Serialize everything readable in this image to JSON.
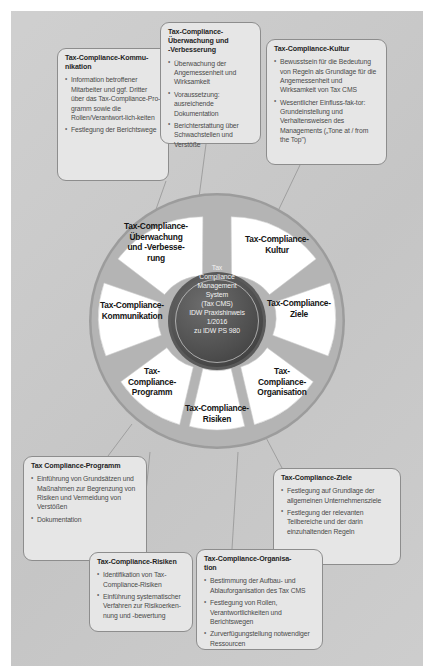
{
  "diagram": {
    "hub": {
      "lines": [
        "Tax",
        "Compliance",
        "Management",
        "System",
        "(Tax CMS)",
        "IDW Praxishinweis",
        "1/2016",
        "zu IDW PS 980"
      ]
    },
    "segments": [
      {
        "id": "kultur",
        "label": "Tax-Compliance-\nKultur"
      },
      {
        "id": "ziele",
        "label": "Tax-Compliance-\nZiele"
      },
      {
        "id": "organisation",
        "label": "Tax-\nCompliance-\nOrganisation"
      },
      {
        "id": "risiken",
        "label": "Tax-Compliance-\nRisiken"
      },
      {
        "id": "programm",
        "label": "Tax-\nCompliance-\nProgramm"
      },
      {
        "id": "kommunikation",
        "label": "Tax-Compliance-\nKommunikation"
      },
      {
        "id": "ueberwachung",
        "label": "Tax-Compliance-\nÜberwachung\nund -Verbesse-\nrung"
      }
    ],
    "callouts": {
      "kommunikation": {
        "title": "Tax-Compliance-Kommu-\nnikation",
        "items": [
          "Information betroffener Mitarbeiter und ggf. Dritter über das Tax-Compliance-Pro-gramm sowie die Rollen/Verantwort-lich-keiten",
          "Festlegung der Berichtswege"
        ]
      },
      "ueberwachung": {
        "title": "Tax-Compliance-\nÜberwachung und\n-Verbesserung",
        "items": [
          "Überwachung der Angemessenheit und Wirksamkeit",
          "Voraussetzung: ausreichende Dokumentation",
          "Berichterstattung über Schwachstellen und Verstöße"
        ]
      },
      "kultur": {
        "title": "Tax-Compliance-Kultur",
        "items": [
          "Bewusstsein für die Bedeutung von Regeln als Grundlage für die Angemessenheit und Wirksamkeit von Tax CMS",
          "Wesentlicher Einfluss-fak-tor: Grundeinstellung und Verhaltensweisen des Managements („Tone at / from the Top\")"
        ]
      },
      "programm": {
        "title": "Tax Compliance-Programm",
        "items": [
          "Einführung von Grundsätzen und Maßnahmen zur Begrenzung von Risiken und Vermeidung von Verstößen",
          "Dokumentation"
        ]
      },
      "ziele": {
        "title": "Tax-Compliance-Ziele",
        "items": [
          "Festlegung auf Grundlage der allgemeinen Unternehmensziele",
          "Festlegung der relevanten Teilbereiche und der darin einzuhaltenden Regeln"
        ]
      },
      "risiken": {
        "title": "Tax-Compliance-Risiken",
        "items": [
          "Identifikation von Tax-Compliance-Risiken",
          "Einführung systematischer Verfahren zur Risikoerken-nung und -bewertung"
        ]
      },
      "organisation": {
        "title": "Tax-Compliance-Organisa-\ntion",
        "items": [
          "Bestimmung der Aufbau- und Ablauforganisation des Tax CMS",
          "Festlegung von Rollen, Verantwortlichkeiten und Berichtswegen",
          "Zurverfügungstellung notwendiger Ressourcen"
        ]
      }
    },
    "colors": {
      "background": "#c9c9c9",
      "callout_fill": "#e6e6e6",
      "callout_border": "#8d8d8d",
      "segment_fill": "#ffffff",
      "hub_fill": "#4c4c4c",
      "spoke": "#8a8a8a"
    }
  }
}
